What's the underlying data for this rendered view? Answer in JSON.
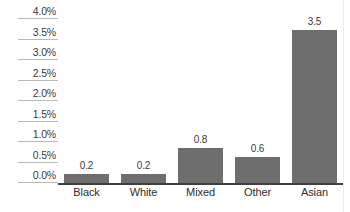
{
  "chart_data": {
    "type": "bar",
    "title": "",
    "subtitle": "",
    "xlabel": "",
    "ylabel": "",
    "categories": [
      "Black",
      "White",
      "Mixed",
      "Other",
      "Asian"
    ],
    "values": [
      0.2,
      0.2,
      0.8,
      0.6,
      3.5
    ],
    "value_labels": [
      "0.2",
      "0.2",
      "0.8",
      "0.6",
      "3.5"
    ],
    "ylim": [
      0,
      4.0
    ],
    "ytick_values": [
      4.0,
      3.5,
      3.0,
      2.5,
      2.0,
      1.5,
      1.0,
      0.5,
      0.0
    ],
    "ytick_labels": [
      "4.0%",
      "3.5%",
      "3.0%",
      "2.5%",
      "2.0%",
      "1.5%",
      "1.0%",
      "0.5%",
      "0.0%"
    ],
    "grid": false,
    "tick_rules": true,
    "legend": null,
    "legend_position": "none",
    "colors": {
      "bar_fill": "#6e6e6e",
      "axis_line": "#3f3f3f",
      "tick_rule": "#b9b9b9",
      "tick_label_text": "#3b3b3b",
      "category_text": "#2e2e2e",
      "background": "#ffffff"
    }
  }
}
